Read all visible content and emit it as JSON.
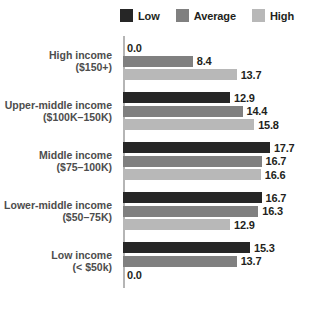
{
  "chart_data": {
    "type": "bar",
    "orientation": "horizontal",
    "title": "",
    "xlabel": "",
    "ylabel": "",
    "grid": false,
    "legend_position": "top",
    "xlim": [
      0,
      17.7
    ],
    "categories": [
      {
        "line1": "High income",
        "line2": "($150+)"
      },
      {
        "line1": "Upper-middle income",
        "line2": "($100K–150K)"
      },
      {
        "line1": "Middle income",
        "line2": "($75–100K)"
      },
      {
        "line1": "Lower-middle income",
        "line2": "($50–75K)"
      },
      {
        "line1": "Low income",
        "line2": "(< $50k)"
      }
    ],
    "series": [
      {
        "name": "Low",
        "color": "#262626",
        "values": [
          0.0,
          12.9,
          17.7,
          16.7,
          15.3
        ]
      },
      {
        "name": "Average",
        "color": "#808080",
        "values": [
          8.4,
          14.4,
          16.7,
          16.3,
          13.7
        ]
      },
      {
        "name": "High",
        "color": "#b8b8b8",
        "values": [
          13.7,
          15.8,
          16.6,
          12.9,
          0.0
        ]
      }
    ],
    "value_labels": [
      [
        "0.0",
        "8.4",
        "13.7"
      ],
      [
        "12.9",
        "14.4",
        "15.8"
      ],
      [
        "17.7",
        "16.7",
        "16.6"
      ],
      [
        "16.7",
        "16.3",
        "12.9"
      ],
      [
        "15.3",
        "13.7",
        "0.0"
      ]
    ]
  },
  "legend": {
    "items": [
      {
        "label": "Low",
        "color": "#262626"
      },
      {
        "label": "Average",
        "color": "#808080"
      },
      {
        "label": "High",
        "color": "#b8b8b8"
      }
    ]
  }
}
